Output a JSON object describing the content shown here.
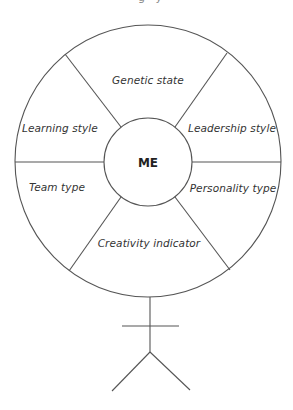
{
  "diagram": {
    "center_label": "ME",
    "segments": [
      {
        "position": "top",
        "label": "Genetic state"
      },
      {
        "position": "upper-left",
        "label": "Learning style"
      },
      {
        "position": "upper-right",
        "label": "Leadership style"
      },
      {
        "position": "lower-left",
        "label": "Team type"
      },
      {
        "position": "lower-right",
        "label": "Personality type"
      },
      {
        "position": "bottom",
        "label": "Creativity indicator"
      }
    ],
    "figure": "stick-figure-holding-wheel",
    "colors": {
      "line": "#555555",
      "text": "#333333",
      "background": "#ffffff"
    }
  }
}
